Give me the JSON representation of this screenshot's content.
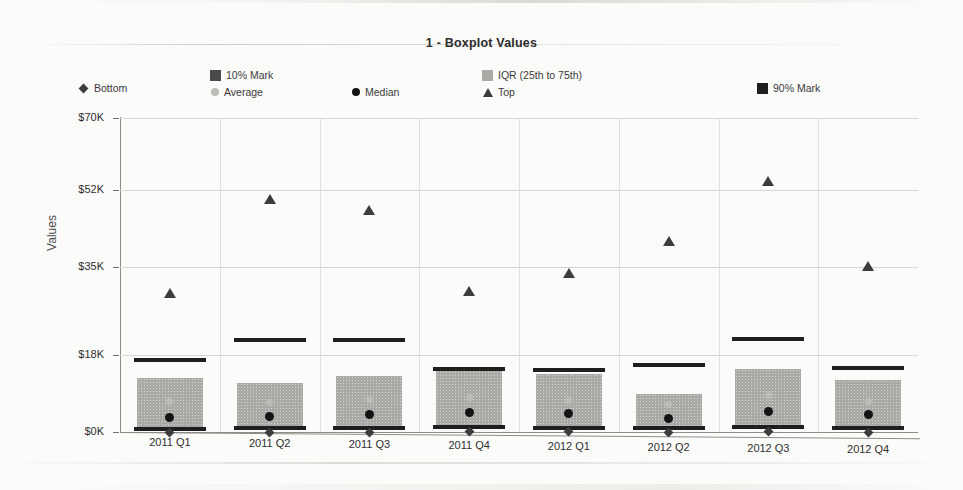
{
  "chart_title": "1 - Boxplot Values",
  "legend": {
    "items": [
      {
        "label": "Bottom",
        "marker": "diamond-marker",
        "color": "#3c3c3c",
        "x": 78,
        "y": 17
      },
      {
        "label": "10% Mark",
        "marker": "square-marker",
        "color": "#4a4a4a",
        "x": 210,
        "y": 4
      },
      {
        "label": "Average",
        "marker": "circle-marker",
        "color": "#bdbdba",
        "x": 211,
        "y": 21
      },
      {
        "label": "Median",
        "marker": "circle-marker",
        "color": "#141414",
        "x": 352,
        "y": 21
      },
      {
        "label": "IQR (25th to 75th)",
        "marker": "square-marker",
        "color": "#a9a9a6",
        "x": 482,
        "y": 4
      },
      {
        "label": "Top",
        "marker": "triangle-marker",
        "color": "#3c3c3c",
        "x": 483,
        "y": 21
      },
      {
        "label": "90% Mark",
        "marker": "square-marker",
        "color": "#1e1e1e",
        "x": 757,
        "y": 17
      }
    ]
  },
  "axes": {
    "y_title": "Values",
    "y_ticks": [
      {
        "label": "$70K",
        "value": 70000,
        "y": 0
      },
      {
        "label": "$52K",
        "value": 52000,
        "y": 72
      },
      {
        "label": "$35K",
        "value": 35000,
        "y": 149
      },
      {
        "label": "$18K",
        "value": 18000,
        "y": 237
      },
      {
        "label": "$0K",
        "value": 0,
        "y": 314
      }
    ]
  },
  "chart_data": {
    "type": "box",
    "title": "1 - Boxplot Values",
    "xlabel": "",
    "ylabel": "Values",
    "ylim": [
      0,
      70000
    ],
    "grid": true,
    "legend_position": "top",
    "categories": [
      "2011 Q1",
      "2011 Q2",
      "2011 Q3",
      "2011 Q4",
      "2012 Q1",
      "2012 Q2",
      "2012 Q3",
      "2012 Q4"
    ],
    "series": [
      {
        "name": "Bottom",
        "values": [
          200,
          300,
          250,
          400,
          350,
          300,
          450,
          300
        ]
      },
      {
        "name": "10% Mark",
        "values": [
          700,
          900,
          800,
          1100,
          1000,
          900,
          1200,
          900
        ]
      },
      {
        "name": "IQR 25th",
        "values": [
          1000,
          1300,
          1200,
          1500,
          1400,
          1200,
          1600,
          1300
        ]
      },
      {
        "name": "Median",
        "values": [
          3200,
          3400,
          3900,
          4300,
          4100,
          3000,
          4500,
          3800
        ]
      },
      {
        "name": "Average",
        "values": [
          6800,
          6500,
          7200,
          7600,
          7000,
          6200,
          8200,
          6900
        ]
      },
      {
        "name": "IQR 75th",
        "values": [
          12000,
          11000,
          12500,
          13500,
          13000,
          8500,
          14000,
          11500
        ]
      },
      {
        "name": "90% Mark",
        "values": [
          16000,
          20500,
          20500,
          14000,
          13800,
          15000,
          20800,
          14200
        ]
      },
      {
        "name": "Top",
        "values": [
          31000,
          52000,
          49500,
          31500,
          35500,
          42500,
          56000,
          37000
        ]
      }
    ],
    "boxes": [
      {
        "category": "2011 Q1",
        "bottom": 200,
        "p10": 700,
        "q1": 1000,
        "median": 3200,
        "average": 6800,
        "q3": 12000,
        "p90": 16000,
        "top": 31000
      },
      {
        "category": "2011 Q2",
        "bottom": 300,
        "p10": 900,
        "q1": 1300,
        "median": 3400,
        "average": 6500,
        "q3": 11000,
        "p90": 20500,
        "top": 52000
      },
      {
        "category": "2011 Q3",
        "bottom": 250,
        "p10": 800,
        "q1": 1200,
        "median": 3900,
        "average": 7200,
        "q3": 12500,
        "p90": 20500,
        "top": 49500
      },
      {
        "category": "2011 Q4",
        "bottom": 400,
        "p10": 1100,
        "q1": 1500,
        "median": 4300,
        "average": 7600,
        "q3": 13500,
        "p90": 14000,
        "top": 31500
      },
      {
        "category": "2012 Q1",
        "bottom": 350,
        "p10": 1000,
        "q1": 1400,
        "median": 4100,
        "average": 7000,
        "q3": 13000,
        "p90": 13800,
        "top": 35500
      },
      {
        "category": "2012 Q2",
        "bottom": 300,
        "p10": 900,
        "q1": 1200,
        "median": 3000,
        "average": 6200,
        "q3": 8500,
        "p90": 15000,
        "top": 42500
      },
      {
        "category": "2012 Q3",
        "bottom": 450,
        "p10": 1200,
        "q1": 1600,
        "median": 4500,
        "average": 8200,
        "q3": 14000,
        "p90": 20800,
        "top": 56000
      },
      {
        "category": "2012 Q4",
        "bottom": 300,
        "p10": 900,
        "q1": 1300,
        "median": 3800,
        "average": 6900,
        "q3": 11500,
        "p90": 14200,
        "top": 37000
      }
    ]
  }
}
